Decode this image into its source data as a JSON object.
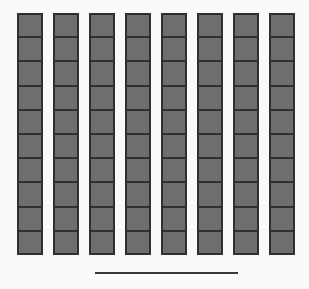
{
  "figure": {
    "background_color": "#fafafa",
    "canvas": {
      "width": 309,
      "height": 289
    }
  },
  "chart_data": {
    "type": "bar",
    "title": "",
    "subtitle": "",
    "xlabel": "",
    "ylabel": "",
    "grid": false,
    "legend": null,
    "orientation": "vertical",
    "units": "blocks",
    "categories": [
      "1",
      "2",
      "3",
      "4",
      "5",
      "6",
      "7",
      "8"
    ],
    "values": [
      10,
      10,
      10,
      10,
      10,
      10,
      10,
      10
    ],
    "ylim": [
      0,
      10
    ],
    "series": [
      {
        "name": "blocks",
        "values": [
          10,
          10,
          10,
          10,
          10,
          10,
          10,
          10
        ]
      }
    ],
    "annotations": [
      {
        "kind": "rule",
        "label": "underline",
        "x_start": 95,
        "x_end": 238,
        "y": 272
      }
    ]
  },
  "style": {
    "block_fill": "#6e6e6e",
    "block_border": "#2f2f2f",
    "rule_color": "#3a3a3a",
    "column_width": 26,
    "column_pitch": 36,
    "column_left_start": 17,
    "column_top": 13,
    "cell_height": 24.2,
    "cells_per_column": 10,
    "rule_thickness": 2
  },
  "labels": {
    "column_names": [
      "column-1",
      "column-2",
      "column-3",
      "column-4",
      "column-5",
      "column-6",
      "column-7",
      "column-8"
    ],
    "rule_name": "baseline-rule"
  }
}
